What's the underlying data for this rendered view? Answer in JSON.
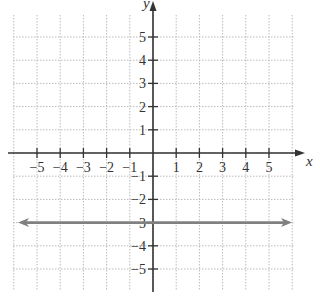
{
  "chart_data": {
    "type": "line",
    "title": "",
    "xlabel": "x",
    "ylabel": "y",
    "xlim": [
      -6,
      6
    ],
    "ylim": [
      -6,
      6
    ],
    "grid": true,
    "grid_style": "dotted",
    "x_ticks": [
      -5,
      -4,
      -3,
      -2,
      -1,
      1,
      2,
      3,
      4,
      5
    ],
    "y_ticks": [
      5,
      4,
      3,
      2,
      1,
      -1,
      -2,
      -3,
      -4,
      -5
    ],
    "x_tick_labels": [
      "−5",
      "−4",
      "−3",
      "−2",
      "−1",
      "1",
      "2",
      "3",
      "4",
      "5"
    ],
    "y_tick_labels": [
      "5",
      "4",
      "3",
      "2",
      "1",
      "−1",
      "−2",
      "−3",
      "−4",
      "−5"
    ],
    "series": [
      {
        "name": "y = -3",
        "equation": "y = -3",
        "x": [
          -6,
          6
        ],
        "y": [
          -3,
          -3
        ],
        "color": "#808080",
        "arrows": "both"
      }
    ]
  },
  "colors": {
    "axis": "#333333",
    "grid": "#bbbbbb",
    "line": "#808080"
  }
}
